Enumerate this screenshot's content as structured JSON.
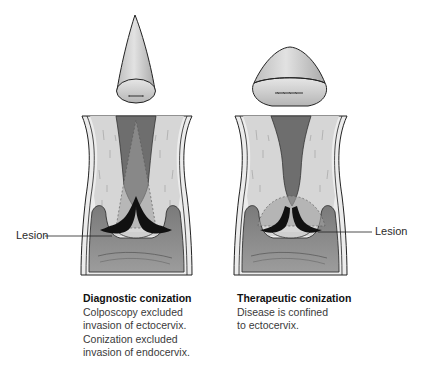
{
  "figure": {
    "left_panel": {
      "specimen": "narrow-cone-specimen",
      "lesion_label": "Lesion",
      "caption": {
        "title": "Diagnostic conization",
        "lines": [
          "Colposcopy excluded",
          "invasion of ectocervix.",
          "Conization excluded",
          "invasion of endocervix."
        ]
      }
    },
    "right_panel": {
      "specimen": "wide-shallow-cone-specimen",
      "lesion_label": "Lesion",
      "caption": {
        "title": "Therapeutic conization",
        "lines": [
          "Disease is confined",
          "to ectocervix."
        ]
      }
    }
  },
  "colors": {
    "background": "#ffffff",
    "specimen_fill": "#cfcfcf",
    "stroma_light": "#d9d9d9",
    "canal_dark": "#6e6e6e",
    "vagina_mid": "#8a8a8a",
    "lesion_black": "#111111",
    "excision_zone": "#a8a8a8"
  }
}
